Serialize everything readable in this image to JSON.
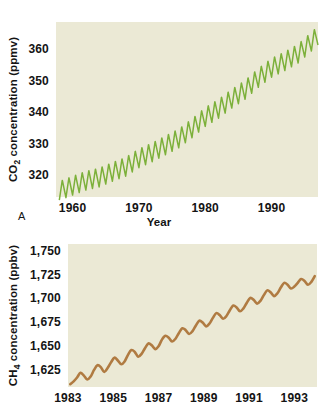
{
  "figure": {
    "background_color": "#ffffff",
    "plot_background_color": "#ebe9d5",
    "text_color": "#141414"
  },
  "chart_data": [
    {
      "id": "co2",
      "type": "line",
      "panel_letter": "A",
      "title": "",
      "xlabel": "Year",
      "ylabel": "CO2 concentration (ppmv)",
      "ylabel_parts": {
        "prefix": "CO",
        "sub": "2",
        "suffix": " concentration (ppmv)"
      },
      "series_name": "Mauna Loa atmospheric CO2",
      "color": "#7cb03a",
      "grid": false,
      "xlim": [
        1957.5,
        1997.0
      ],
      "ylim": [
        313.0,
        368.5
      ],
      "xticks": [
        1960,
        1970,
        1980,
        1990
      ],
      "xticklabels": [
        "1960",
        "1970",
        "1980",
        "1990"
      ],
      "yticks": [
        320,
        330,
        340,
        350,
        360
      ],
      "yticklabels": [
        "320",
        "330",
        "340",
        "350",
        "360"
      ],
      "seasonal_amplitude_ppmv": 3.0,
      "seasonal_period_years": 1.0,
      "trend_x": [
        1958,
        1960,
        1962,
        1964,
        1966,
        1968,
        1970,
        1972,
        1974,
        1976,
        1978,
        1980,
        1982,
        1984,
        1986,
        1988,
        1990,
        1992,
        1994,
        1996,
        1997
      ],
      "trend_y": [
        315.0,
        316.6,
        318.2,
        319.2,
        321.0,
        322.6,
        325.3,
        327.2,
        329.4,
        331.6,
        334.8,
        338.4,
        341.0,
        344.2,
        347.0,
        350.8,
        354.0,
        356.1,
        358.5,
        362.3,
        364.2
      ]
    },
    {
      "id": "ch4",
      "type": "line",
      "panel_letter": "",
      "title": "",
      "xlabel": "",
      "ylabel": "CH4 concentration (ppbv)",
      "ylabel_parts": {
        "prefix": "CH",
        "sub": "4",
        "suffix": " concentration (ppbv)"
      },
      "series_name": "Global atmospheric CH4",
      "color": "#b07b42",
      "grid": false,
      "xlim": [
        1983.0,
        1994.0
      ],
      "ylim": [
        1606.0,
        1757.0
      ],
      "xticks": [
        1983,
        1985,
        1987,
        1989,
        1991,
        1993
      ],
      "xticklabels": [
        "1983",
        "1985",
        "1987",
        "1989",
        "1991",
        "1993"
      ],
      "yticks": [
        1625,
        1650,
        1675,
        1700,
        1725,
        1750
      ],
      "yticklabels": [
        "1,625",
        "1,650",
        "1,675",
        "1,700",
        "1,725",
        "1,750"
      ],
      "x": [
        1983.1,
        1983.25,
        1983.4,
        1983.55,
        1983.7,
        1983.85,
        1984.0,
        1984.15,
        1984.3,
        1984.45,
        1984.6,
        1984.75,
        1984.9,
        1985.05,
        1985.2,
        1985.35,
        1985.5,
        1985.65,
        1985.8,
        1985.95,
        1986.1,
        1986.25,
        1986.4,
        1986.55,
        1986.7,
        1986.85,
        1987.0,
        1987.15,
        1987.3,
        1987.45,
        1987.6,
        1987.75,
        1987.9,
        1988.05,
        1988.2,
        1988.35,
        1988.5,
        1988.65,
        1988.8,
        1988.95,
        1989.1,
        1989.25,
        1989.4,
        1989.55,
        1989.7,
        1989.85,
        1990.0,
        1990.15,
        1990.3,
        1990.45,
        1990.6,
        1990.75,
        1990.9,
        1991.05,
        1991.2,
        1991.35,
        1991.5,
        1991.65,
        1991.8,
        1991.95,
        1992.1,
        1992.25,
        1992.4,
        1992.55,
        1992.7,
        1992.85,
        1993.0,
        1993.15,
        1993.3,
        1993.45,
        1993.6,
        1993.75,
        1993.9
      ],
      "y": [
        1609,
        1612,
        1616,
        1621,
        1618,
        1614,
        1617,
        1624,
        1629,
        1627,
        1622,
        1626,
        1632,
        1637,
        1634,
        1630,
        1633,
        1640,
        1645,
        1643,
        1638,
        1641,
        1647,
        1652,
        1650,
        1646,
        1649,
        1656,
        1660,
        1658,
        1654,
        1657,
        1663,
        1668,
        1666,
        1662,
        1665,
        1671,
        1676,
        1674,
        1670,
        1673,
        1679,
        1684,
        1682,
        1678,
        1681,
        1687,
        1692,
        1690,
        1686,
        1689,
        1695,
        1700,
        1698,
        1694,
        1697,
        1703,
        1708,
        1706,
        1702,
        1705,
        1711,
        1716,
        1714,
        1710,
        1712,
        1716,
        1720,
        1718,
        1714,
        1717,
        1723
      ]
    }
  ],
  "panel_a_letter": "A"
}
